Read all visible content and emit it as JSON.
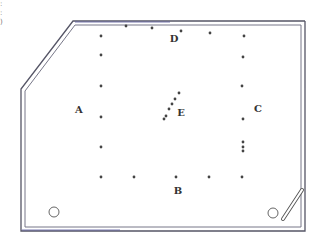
{
  "diagram": {
    "type": "billiard-table-layout",
    "colors": {
      "frame_outer": "#555566",
      "frame_inner": "#777788",
      "top_accent": "#5a5aa0",
      "dot": "#444444",
      "label": "#333333"
    },
    "labels": [
      {
        "id": "A",
        "text": "A",
        "x": 79,
        "y": 113
      },
      {
        "id": "B",
        "text": "B",
        "x": 178,
        "y": 194
      },
      {
        "id": "C",
        "text": "C",
        "x": 258,
        "y": 112
      },
      {
        "id": "D",
        "text": "D",
        "x": 174,
        "y": 42
      },
      {
        "id": "E",
        "text": "E",
        "x": 181,
        "y": 116
      }
    ],
    "dots": [
      {
        "x": 126,
        "y": 26
      },
      {
        "x": 152,
        "y": 28
      },
      {
        "x": 181,
        "y": 31
      },
      {
        "x": 210,
        "y": 33
      },
      {
        "x": 101,
        "y": 36
      },
      {
        "x": 244,
        "y": 36
      },
      {
        "x": 101,
        "y": 55
      },
      {
        "x": 243,
        "y": 57
      },
      {
        "x": 101,
        "y": 86
      },
      {
        "x": 242,
        "y": 86
      },
      {
        "x": 101,
        "y": 117
      },
      {
        "x": 243,
        "y": 119
      },
      {
        "x": 101,
        "y": 147
      },
      {
        "x": 243,
        "y": 142
      },
      {
        "x": 243,
        "y": 147
      },
      {
        "x": 243,
        "y": 151
      },
      {
        "x": 101,
        "y": 177
      },
      {
        "x": 134,
        "y": 177
      },
      {
        "x": 176,
        "y": 177
      },
      {
        "x": 209,
        "y": 177
      },
      {
        "x": 242,
        "y": 177
      },
      {
        "x": 179,
        "y": 93
      },
      {
        "x": 175,
        "y": 99
      },
      {
        "x": 172,
        "y": 104
      },
      {
        "x": 169,
        "y": 109
      },
      {
        "x": 166,
        "y": 116
      },
      {
        "x": 164,
        "y": 119
      }
    ],
    "pockets": [
      {
        "name": "left-bottom-circle",
        "x": 54,
        "y": 212,
        "r": 5
      },
      {
        "name": "right-bottom-circle",
        "x": 273,
        "y": 213,
        "r": 5
      }
    ],
    "cue_stick": {
      "x1": 283,
      "y1": 219,
      "x2": 302,
      "y2": 190
    },
    "edge_fragment": ":\n:\n)"
  }
}
